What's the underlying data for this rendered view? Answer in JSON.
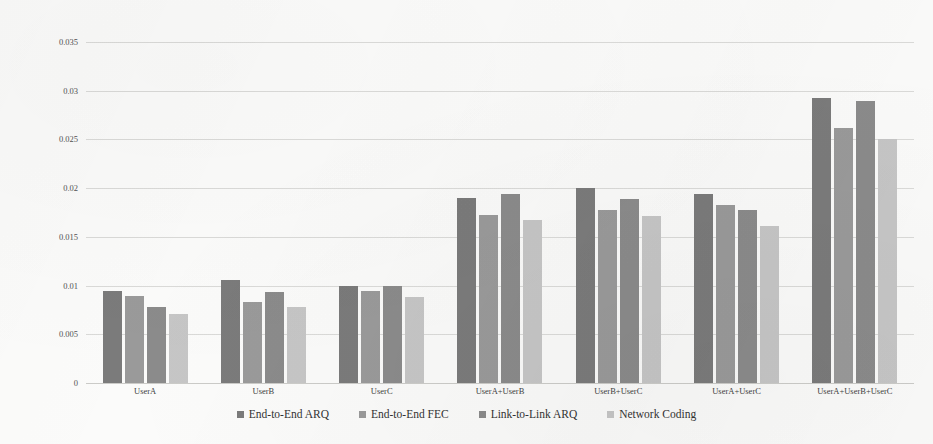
{
  "chart_data": {
    "type": "bar",
    "title": "",
    "xlabel": "",
    "ylabel": "Packet Retransmission Frequency",
    "ylim": [
      0,
      0.035
    ],
    "ytick_labels": [
      "0.035",
      "0.03",
      "0.025",
      "0.02",
      "0.015",
      "0.01",
      "0.005",
      "0"
    ],
    "ytick_values": [
      0.035,
      0.03,
      0.025,
      0.02,
      0.015,
      0.01,
      0.005,
      0
    ],
    "grid": true,
    "legend_position": "bottom",
    "categories": [
      "UserA",
      "UserB",
      "UserC",
      "UserA+UserB",
      "UserB+UserC",
      "UserA+UserC",
      "UserA+UserB+UserC"
    ],
    "series": [
      {
        "name": "End-to-End ARQ",
        "color": "#7b7b7b",
        "values": [
          0.0094,
          0.0106,
          0.01,
          0.019,
          0.02,
          0.0194,
          0.0293
        ]
      },
      {
        "name": "End-to-End FEC",
        "color": "#9a9a9a",
        "values": [
          0.0089,
          0.0083,
          0.0094,
          0.0172,
          0.0178,
          0.0183,
          0.0262
        ]
      },
      {
        "name": "Link-to-Link ARQ",
        "color": "#8b8b8b",
        "values": [
          0.0078,
          0.0093,
          0.01,
          0.0194,
          0.0189,
          0.0178,
          0.0289
        ]
      },
      {
        "name": "Network Coding",
        "color": "#c6c6c6",
        "values": [
          0.0071,
          0.0078,
          0.0088,
          0.0167,
          0.0171,
          0.0161,
          0.025
        ]
      }
    ]
  }
}
